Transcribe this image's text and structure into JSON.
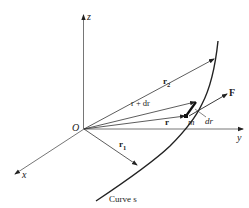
{
  "figure": {
    "type": "vector-diagram",
    "colors": {
      "ink": "#222222",
      "background": "#ffffff"
    }
  },
  "axes": {
    "x_label": "x",
    "y_label": "y",
    "z_label": "z",
    "origin_label": "O"
  },
  "vectors": {
    "r1_label": "r",
    "r1_sub": "1",
    "r2_label": "r",
    "r2_sub": "2",
    "r_label": "r",
    "r_plus_dr_label": "r + dr",
    "force_label": "F",
    "dr_label": "dr",
    "mass_label": "m"
  },
  "curve": {
    "label": "Curve s"
  }
}
